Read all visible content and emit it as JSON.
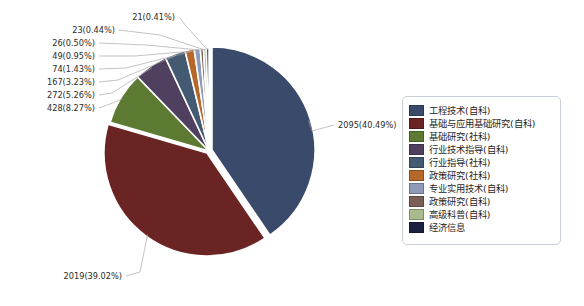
{
  "chart_data": {
    "type": "pie",
    "title": "",
    "categories": [
      "工程技术(自科)",
      "基础与应用基础研究(自科)",
      "基础研究(社科)",
      "行业技术指导(自科)",
      "行业指导(社科)",
      "政策研究(社科)",
      "专业实用技术(自科)",
      "政策研究(自科)",
      "高级科普(自科)",
      "经济信息"
    ],
    "values": [
      2095,
      2019,
      428,
      272,
      167,
      74,
      49,
      26,
      23,
      21
    ],
    "percents": [
      40.49,
      39.02,
      8.27,
      5.26,
      3.23,
      1.43,
      0.95,
      0.5,
      0.44,
      0.41
    ],
    "data_labels": [
      "2095(40.49%)",
      "2019(39.02%)",
      "428(8.27%)",
      "272(5.26%)",
      "167(3.23%)",
      "74(1.43%)",
      "49(0.95%)",
      "26(0.50%)",
      "23(0.44%)",
      "21(0.41%)"
    ],
    "colors": [
      "#3a4a6b",
      "#6b2424",
      "#5d7a33",
      "#4f4060",
      "#445a72",
      "#b5682a",
      "#8e9ab8",
      "#7a5f57",
      "#a8bc8e",
      "#1a2040"
    ],
    "legend_position": "right",
    "grid": false,
    "xlabel": "",
    "ylabel": ""
  },
  "legend": {
    "items": [
      {
        "label": "工程技术(自科)",
        "color": "#3a4a6b"
      },
      {
        "label": "基础与应用基础研究(自科)",
        "color": "#6b2424"
      },
      {
        "label": "基础研究(社科)",
        "color": "#5d7a33"
      },
      {
        "label": "行业技术指导(自科)",
        "color": "#4f4060"
      },
      {
        "label": "行业指导(社科)",
        "color": "#445a72"
      },
      {
        "label": "政策研究(社科)",
        "color": "#b5682a"
      },
      {
        "label": "专业实用技术(自科)",
        "color": "#8e9ab8"
      },
      {
        "label": "政策研究(自科)",
        "color": "#7a5f57"
      },
      {
        "label": "高级科普(自科)",
        "color": "#a8bc8e"
      },
      {
        "label": "经济信息",
        "color": "#1a2040"
      }
    ]
  },
  "annotations": {
    "right_label": "2095(40.49%)",
    "bottom_label": "2019(39.02%)",
    "left_labels": [
      "428(8.27%)",
      "272(5.26%)",
      "167(3.23%)",
      "74(1.43%)",
      "49(0.95%)",
      "26(0.50%)",
      "23(0.44%)",
      "21(0.41%)"
    ]
  }
}
